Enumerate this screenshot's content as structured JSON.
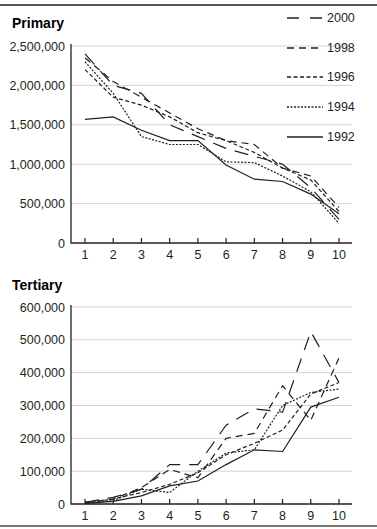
{
  "chart_data": [
    {
      "type": "line",
      "title": "Primary",
      "xlabel": "",
      "ylabel": "",
      "x": [
        1,
        2,
        3,
        4,
        5,
        6,
        7,
        8,
        9,
        10
      ],
      "ylim": [
        0,
        2500000
      ],
      "yticks": [
        "0",
        "500,000",
        "1,000,000",
        "1,500,000",
        "2,000,000",
        "2,500,000"
      ],
      "grid": true,
      "legend_position": "upper right",
      "series": [
        {
          "name": "2000",
          "style": "long-dash",
          "values": [
            2400000,
            2000000,
            1900000,
            1500000,
            1350000,
            1200000,
            1100000,
            1000000,
            700000,
            300000
          ]
        },
        {
          "name": "1998",
          "style": "dash",
          "values": [
            2350000,
            2050000,
            1850000,
            1650000,
            1450000,
            1300000,
            1250000,
            950000,
            850000,
            450000
          ]
        },
        {
          "name": "1996",
          "style": "short-dash",
          "values": [
            2200000,
            1850000,
            1750000,
            1600000,
            1400000,
            1300000,
            1150000,
            950000,
            800000,
            400000
          ]
        },
        {
          "name": "1994",
          "style": "dotted",
          "values": [
            2300000,
            1900000,
            1350000,
            1250000,
            1250000,
            1030000,
            1020000,
            850000,
            650000,
            250000
          ]
        },
        {
          "name": "1992",
          "style": "solid",
          "values": [
            1570000,
            1600000,
            1430000,
            1300000,
            1300000,
            990000,
            810000,
            780000,
            620000,
            370000
          ]
        }
      ]
    },
    {
      "type": "line",
      "title": "Tertiary",
      "xlabel": "",
      "ylabel": "",
      "x": [
        1,
        2,
        3,
        4,
        5,
        6,
        7,
        8,
        9,
        10
      ],
      "ylim": [
        0,
        600000
      ],
      "yticks": [
        "0",
        "100,000",
        "200,000",
        "300,000",
        "400,000",
        "500,000",
        "600,000"
      ],
      "grid": true,
      "series": [
        {
          "name": "2000",
          "style": "long-dash",
          "values": [
            5000,
            20000,
            45000,
            120000,
            120000,
            240000,
            290000,
            280000,
            525000,
            370000
          ]
        },
        {
          "name": "1998",
          "style": "dash",
          "values": [
            5000,
            15000,
            50000,
            105000,
            80000,
            200000,
            215000,
            360000,
            255000,
            445000
          ]
        },
        {
          "name": "1996",
          "style": "short-dash",
          "values": [
            3000,
            15000,
            35000,
            60000,
            95000,
            150000,
            185000,
            225000,
            335000,
            370000
          ]
        },
        {
          "name": "1994",
          "style": "dotted",
          "values": [
            2000,
            10000,
            45000,
            35000,
            100000,
            155000,
            165000,
            300000,
            340000,
            350000
          ]
        },
        {
          "name": "1992",
          "style": "solid",
          "values": [
            2000,
            8000,
            25000,
            55000,
            70000,
            120000,
            165000,
            160000,
            295000,
            325000
          ]
        }
      ]
    }
  ],
  "legend": [
    {
      "label": "2000",
      "style": "long-dash"
    },
    {
      "label": "1998",
      "style": "dash"
    },
    {
      "label": "1996",
      "style": "short-dash"
    },
    {
      "label": "1994",
      "style": "dotted"
    },
    {
      "label": "1992",
      "style": "solid"
    }
  ],
  "xticks": [
    "1",
    "2",
    "3",
    "4",
    "5",
    "6",
    "7",
    "8",
    "9",
    "10"
  ],
  "colors": {
    "line": "#231f20",
    "grid": "#d4d4d4"
  }
}
